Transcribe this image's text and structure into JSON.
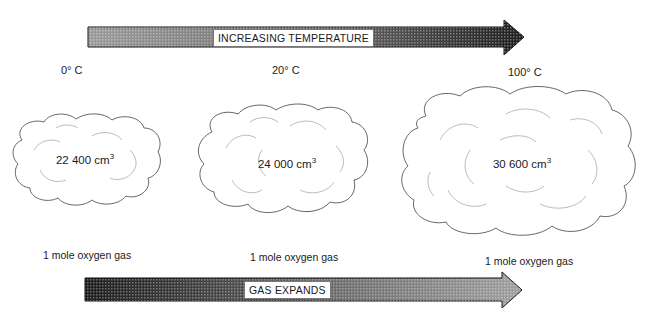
{
  "diagram": {
    "temperature_arrow": {
      "label": "INCREASING TEMPERATURE",
      "direction": "right",
      "shading": "light-to-dark"
    },
    "expansion_arrow": {
      "label": "GAS EXPANDS",
      "direction": "right",
      "shading": "dark-to-light"
    },
    "temperatures": [
      "0° C",
      "20° C",
      "100° C"
    ],
    "samples": [
      {
        "temperature": "0° C",
        "volume_value": "22 400 cm",
        "volume_exponent": "3",
        "caption": "1 mole oxygen gas"
      },
      {
        "temperature": "20° C",
        "volume_value": "24 000 cm",
        "volume_exponent": "3",
        "caption": "1 mole oxygen gas"
      },
      {
        "temperature": "100° C",
        "volume_value": "30 600 cm",
        "volume_exponent": "3",
        "caption": "1 mole oxygen gas"
      }
    ],
    "colors": {
      "arrow_light": "#9a9a9a",
      "arrow_dark": "#1e1e1e",
      "cloud_outline": "#555555",
      "cloud_inner": "#aaaaaa",
      "text": "#1a1a1a"
    }
  }
}
